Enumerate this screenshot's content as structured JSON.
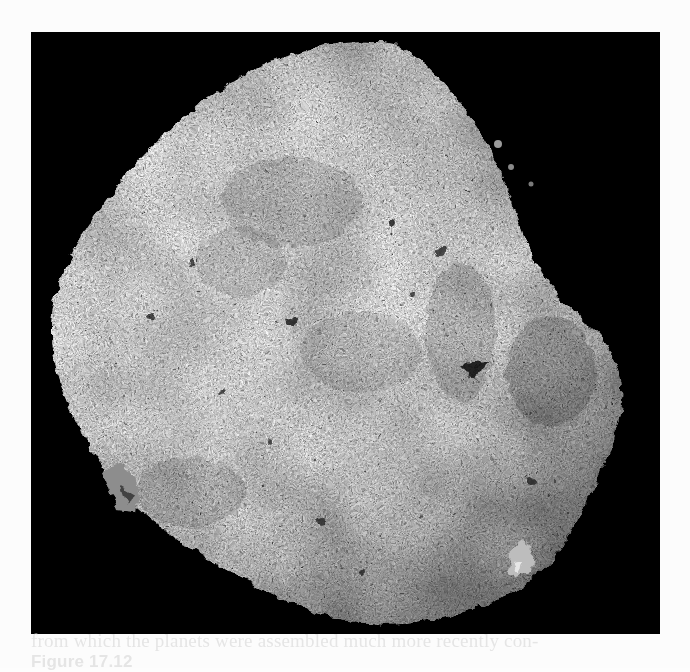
{
  "figure": {
    "background_color": "#000000",
    "surface_color": "#8a8a8a",
    "highlight_color": "#d8d8d8"
  },
  "bleed_through": {
    "line1": "from which the planets were assembled much more recently con-",
    "line2_label": "Figure 17.12",
    "line2_rest": ""
  }
}
